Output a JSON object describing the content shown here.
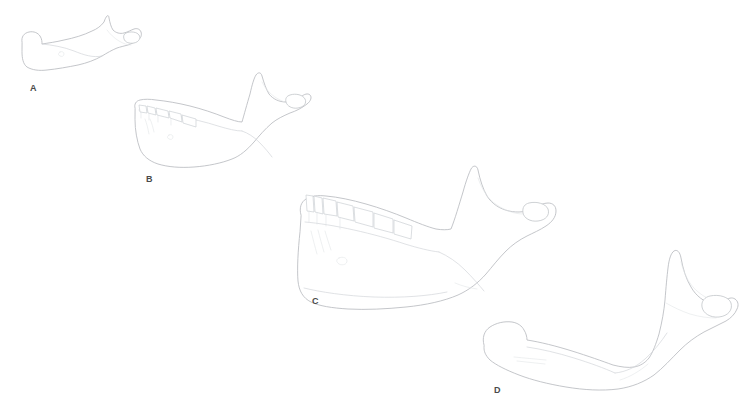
{
  "figure": {
    "background_color": "#ffffff",
    "outline_color": "#b9bcc0",
    "detail_color": "#d3d6da",
    "label_color": "#4a4a4a",
    "width": 748,
    "height": 418
  },
  "specimens": [
    {
      "label": "A",
      "name": "mandible-a",
      "description": "smallest edentulous mandible, upper-left",
      "label_x": 30,
      "label_y": 84,
      "teeth_count": 0
    },
    {
      "label": "B",
      "name": "mandible-b",
      "description": "small mandible with partial tooth row",
      "label_x": 146,
      "label_y": 175,
      "teeth_count": 5
    },
    {
      "label": "C",
      "name": "mandible-c",
      "description": "large mandible with full tooth row",
      "label_x": 312,
      "label_y": 297,
      "teeth_count": 7
    },
    {
      "label": "D",
      "name": "mandible-d",
      "description": "large edentulous mandible, lower-right",
      "label_x": 494,
      "label_y": 386,
      "teeth_count": 0
    }
  ]
}
